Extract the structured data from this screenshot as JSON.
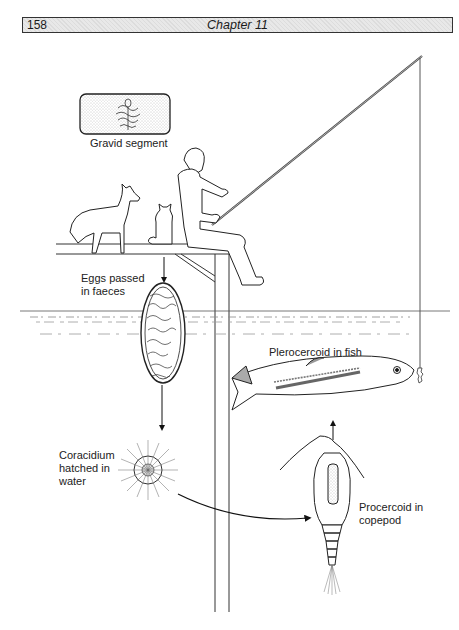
{
  "header": {
    "page_number": "158",
    "chapter_title": "Chapter 11"
  },
  "figure": {
    "labels": {
      "gravid_segment": "Gravid segment",
      "eggs_line1": "Eggs passed",
      "eggs_line2": "in faeces",
      "coracidium_line1": "Coracidium",
      "coracidium_line2": "hatched in",
      "coracidium_line3": "water",
      "plerocercoid": "Plerocercoid in fish",
      "procercoid_line1": "Procercoid in",
      "procercoid_line2": "copepod"
    }
  }
}
